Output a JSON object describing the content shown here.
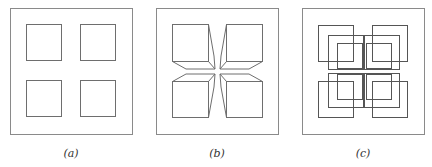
{
  "figure": {
    "panels": [
      {
        "id": "a",
        "caption": "(a)",
        "description": "Square frame containing four separated squares",
        "frame": {
          "x": 10,
          "y": 8,
          "w": 122,
          "h": 126
        },
        "squares": [
          {
            "x": 26,
            "y": 24,
            "w": 35,
            "h": 36
          },
          {
            "x": 80,
            "y": 24,
            "w": 35,
            "h": 36
          },
          {
            "x": 26,
            "y": 80,
            "w": 35,
            "h": 36
          },
          {
            "x": 80,
            "y": 80,
            "w": 35,
            "h": 36
          }
        ]
      },
      {
        "id": "b",
        "caption": "(b)",
        "description": "Square frame containing four squares with slanted edges converging to the center",
        "frame": {
          "x": 156,
          "y": 8,
          "w": 122,
          "h": 126
        },
        "center": {
          "x": 217,
          "y": 71
        }
      },
      {
        "id": "c",
        "caption": "(c)",
        "description": "Square frame containing four groups of three overlapping squares shifting toward the center",
        "frame": {
          "x": 302,
          "y": 8,
          "w": 122,
          "h": 126
        }
      }
    ]
  }
}
